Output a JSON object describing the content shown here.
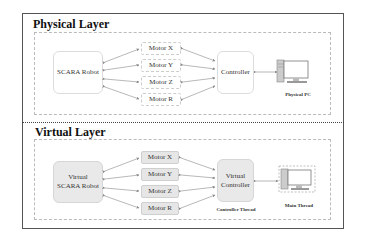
{
  "physical_layer": {
    "title": "Physical Layer",
    "robot": "SCARA Robot",
    "motors": [
      "Motor X",
      "Motor Y",
      "Motor Z",
      "Motor R"
    ],
    "controller": "Controller",
    "pc_label": "Physical PC"
  },
  "virtual_layer": {
    "title": "Virtual Layer",
    "robot_line1": "Virtual",
    "robot_line2": "SCARA Robot",
    "motors": [
      "Motor X",
      "Motor Y",
      "Motor Z",
      "Motor R"
    ],
    "controller_line1": "Virtual",
    "controller_line2": "Controller",
    "controller_caption": "Controller Thread",
    "pc_label": "Main Thread"
  },
  "colors": {
    "virtual_fill": "#e8e8e8",
    "arrow": "#888888",
    "border": "#555555"
  }
}
